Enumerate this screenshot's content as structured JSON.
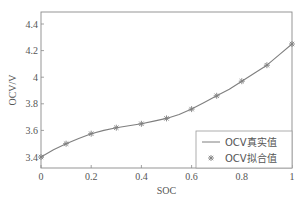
{
  "chart_data": {
    "type": "line",
    "title": "",
    "xlabel": "SOC",
    "ylabel": "OCV/V",
    "xlim": [
      0,
      1
    ],
    "ylim": [
      3.36,
      4.5
    ],
    "xticks": [
      0,
      0.2,
      0.4,
      0.6,
      0.8,
      1
    ],
    "xtick_labels": [
      "0",
      "0.2",
      "0.4",
      "0.6",
      "0.8",
      "1"
    ],
    "yticks": [
      3.4,
      3.6,
      3.8,
      4.0,
      4.2,
      4.4
    ],
    "ytick_labels": [
      "3.4",
      "3.6",
      "3.8",
      "4",
      "4.2",
      "4.4"
    ],
    "grid": false,
    "legend_position": "lower right",
    "series": [
      {
        "name": "OCV真实值",
        "style": "line",
        "color": "#7f7f7f",
        "x": [
          0,
          0.05,
          0.1,
          0.15,
          0.2,
          0.25,
          0.3,
          0.35,
          0.4,
          0.45,
          0.5,
          0.55,
          0.6,
          0.65,
          0.7,
          0.75,
          0.8,
          0.85,
          0.9,
          0.95,
          1.0
        ],
        "y": [
          3.4,
          3.455,
          3.5,
          3.54,
          3.575,
          3.6,
          3.62,
          3.635,
          3.65,
          3.67,
          3.69,
          3.72,
          3.76,
          3.81,
          3.86,
          3.91,
          3.97,
          4.03,
          4.09,
          4.17,
          4.25
        ]
      },
      {
        "name": "OCV拟合值",
        "style": "marker",
        "marker": "asterisk",
        "color": "#7f7f7f",
        "x": [
          0,
          0.1,
          0.2,
          0.3,
          0.4,
          0.5,
          0.6,
          0.7,
          0.8,
          0.9,
          1.0
        ],
        "y": [
          3.4,
          3.5,
          3.575,
          3.62,
          3.65,
          3.69,
          3.76,
          3.86,
          3.97,
          4.09,
          4.25
        ]
      }
    ]
  },
  "legend": {
    "items": [
      {
        "label": "OCV真实值",
        "symbol": "—"
      },
      {
        "label": "OCV拟合值",
        "symbol": "*"
      }
    ]
  }
}
